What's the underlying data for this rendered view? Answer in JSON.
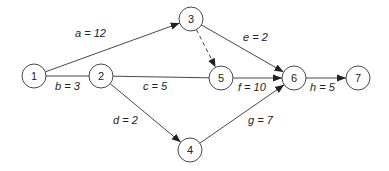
{
  "diagram": {
    "type": "activity-network",
    "nodes": [
      {
        "id": "1",
        "label": "1",
        "x": 34,
        "y": 76
      },
      {
        "id": "2",
        "label": "2",
        "x": 101,
        "y": 76
      },
      {
        "id": "3",
        "label": "3",
        "x": 191,
        "y": 19
      },
      {
        "id": "4",
        "label": "4",
        "x": 190,
        "y": 150
      },
      {
        "id": "5",
        "label": "5",
        "x": 221,
        "y": 78
      },
      {
        "id": "6",
        "label": "6",
        "x": 294,
        "y": 78
      },
      {
        "id": "7",
        "label": "7",
        "x": 358,
        "y": 78
      }
    ],
    "edges": [
      {
        "from": "1",
        "to": "3",
        "label": "a = 12",
        "dashed": false,
        "arrow": true,
        "lx": 75,
        "ly": 37
      },
      {
        "from": "1",
        "to": "2",
        "label": "b = 3",
        "dashed": false,
        "arrow": false,
        "lx": 55,
        "ly": 90
      },
      {
        "from": "2",
        "to": "6",
        "label": "c = 5",
        "dashed": false,
        "arrow": false,
        "lx": 143,
        "ly": 90,
        "via": "5"
      },
      {
        "from": "2",
        "to": "4",
        "label": "d = 2",
        "dashed": false,
        "arrow": true,
        "lx": 113,
        "ly": 124
      },
      {
        "from": "3",
        "to": "6",
        "label": "e = 2",
        "dashed": false,
        "arrow": true,
        "lx": 243,
        "ly": 41
      },
      {
        "from": "3",
        "to": "5",
        "label": "",
        "dashed": true,
        "arrow": true
      },
      {
        "from": "5",
        "to": "6",
        "label": "f = 10",
        "dashed": false,
        "arrow": true,
        "lx": 238,
        "ly": 91
      },
      {
        "from": "4",
        "to": "6",
        "label": "g = 7",
        "dashed": false,
        "arrow": true,
        "lx": 248,
        "ly": 124
      },
      {
        "from": "6",
        "to": "7",
        "label": "h = 5",
        "dashed": false,
        "arrow": true,
        "lx": 310,
        "ly": 91
      }
    ],
    "node_radius": 12,
    "colors": {
      "stroke": "#333333",
      "text": "#222222",
      "background": "#ffffff"
    }
  }
}
